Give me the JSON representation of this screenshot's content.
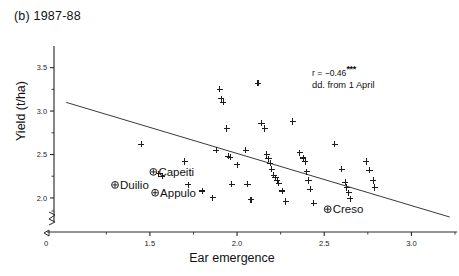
{
  "panel": {
    "label": "(b)  1987-88"
  },
  "chart_data": {
    "type": "scatter",
    "title": "(b) 1987-88",
    "xlabel": "Ear emergence",
    "ylabel": "Yield (t/ha)",
    "xlim": [
      0.95,
      3.25
    ],
    "ylim": [
      1.7,
      3.68
    ],
    "grid": false,
    "legend": null,
    "xticks": [
      {
        "value": 0,
        "label": "0",
        "origin": true
      },
      {
        "value": 1.5,
        "label": "1.5"
      },
      {
        "value": 2.0,
        "label": "2.0"
      },
      {
        "value": 2.5,
        "label": "2.5"
      },
      {
        "value": 3.0,
        "label": "3.0"
      }
    ],
    "xminor": [
      1.25,
      1.75,
      2.25,
      2.75,
      3.25
    ],
    "yticks": [
      {
        "value": 3.5,
        "label": "3.5"
      },
      {
        "value": 3.0,
        "label": "3.0"
      },
      {
        "value": 2.5,
        "label": "2.5"
      },
      {
        "value": 2.0,
        "label": "2.0"
      }
    ],
    "yminor": [
      3.25,
      2.75,
      2.25,
      1.85
    ],
    "axis_break": true,
    "annotation": {
      "correlation_text": "r = −0.46",
      "significance": "***",
      "note": "dd. from 1 April"
    },
    "trendline": {
      "x": [
        1.02,
        3.22
      ],
      "y": [
        3.1,
        1.78
      ]
    },
    "points": [
      {
        "x": 1.45,
        "y": 2.62
      },
      {
        "x": 1.55,
        "y": 2.28
      },
      {
        "x": 1.57,
        "y": 2.25
      },
      {
        "x": 1.7,
        "y": 2.42
      },
      {
        "x": 1.72,
        "y": 2.15
      },
      {
        "x": 1.8,
        "y": 2.08
      },
      {
        "x": 1.86,
        "y": 2.0
      },
      {
        "x": 1.88,
        "y": 2.55
      },
      {
        "x": 1.9,
        "y": 3.25
      },
      {
        "x": 1.91,
        "y": 3.14
      },
      {
        "x": 1.92,
        "y": 3.1
      },
      {
        "x": 1.94,
        "y": 2.8
      },
      {
        "x": 1.95,
        "y": 2.48
      },
      {
        "x": 1.96,
        "y": 2.47
      },
      {
        "x": 1.97,
        "y": 2.16
      },
      {
        "x": 2.0,
        "y": 2.38
      },
      {
        "x": 2.05,
        "y": 2.55
      },
      {
        "x": 2.06,
        "y": 2.16
      },
      {
        "x": 2.08,
        "y": 1.98
      },
      {
        "x": 2.12,
        "y": 3.32
      },
      {
        "x": 2.14,
        "y": 2.86
      },
      {
        "x": 2.16,
        "y": 2.8
      },
      {
        "x": 2.17,
        "y": 2.5
      },
      {
        "x": 2.18,
        "y": 2.45
      },
      {
        "x": 2.19,
        "y": 2.4
      },
      {
        "x": 2.2,
        "y": 2.33
      },
      {
        "x": 2.21,
        "y": 2.26
      },
      {
        "x": 2.22,
        "y": 2.23
      },
      {
        "x": 2.23,
        "y": 2.2
      },
      {
        "x": 2.24,
        "y": 2.17
      },
      {
        "x": 2.26,
        "y": 2.08
      },
      {
        "x": 2.28,
        "y": 1.96
      },
      {
        "x": 2.32,
        "y": 2.88
      },
      {
        "x": 2.36,
        "y": 2.52
      },
      {
        "x": 2.38,
        "y": 2.46
      },
      {
        "x": 2.39,
        "y": 2.42
      },
      {
        "x": 2.4,
        "y": 2.3
      },
      {
        "x": 2.41,
        "y": 2.2
      },
      {
        "x": 2.42,
        "y": 2.1
      },
      {
        "x": 2.44,
        "y": 1.94
      },
      {
        "x": 2.56,
        "y": 2.62
      },
      {
        "x": 2.6,
        "y": 2.33
      },
      {
        "x": 2.62,
        "y": 2.18
      },
      {
        "x": 2.63,
        "y": 2.12
      },
      {
        "x": 2.64,
        "y": 2.06
      },
      {
        "x": 2.65,
        "y": 1.99
      },
      {
        "x": 2.74,
        "y": 2.42
      },
      {
        "x": 2.76,
        "y": 2.32
      },
      {
        "x": 2.78,
        "y": 2.2
      },
      {
        "x": 2.79,
        "y": 2.12
      }
    ],
    "cultivars": [
      {
        "name": "Capeiti",
        "x": 1.52,
        "y": 2.3,
        "label_side": "right"
      },
      {
        "name": "Duilio",
        "x": 1.3,
        "y": 2.15,
        "label_side": "right"
      },
      {
        "name": "Appulo",
        "x": 1.53,
        "y": 2.06,
        "label_side": "right"
      },
      {
        "name": "Creso",
        "x": 2.52,
        "y": 1.87,
        "label_side": "right"
      }
    ]
  }
}
